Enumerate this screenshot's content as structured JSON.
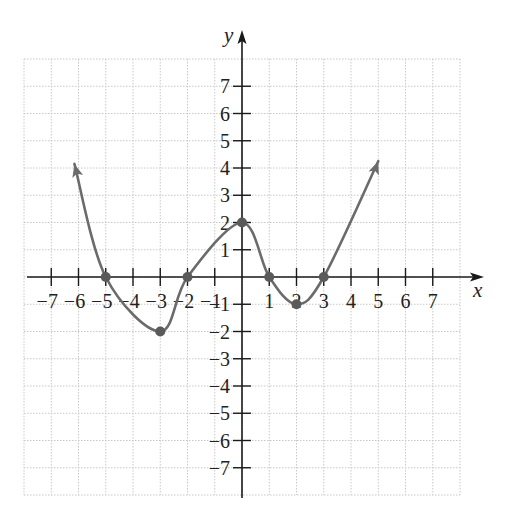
{
  "chart_data": {
    "type": "line",
    "title": "",
    "xlabel": "x",
    "ylabel": "y",
    "xlim": [
      -8,
      8
    ],
    "ylim": [
      -8,
      8
    ],
    "grid": true,
    "grid_style": "dotted",
    "x_ticks": [
      -7,
      -6,
      -5,
      -4,
      -3,
      -2,
      -1,
      1,
      2,
      3,
      4,
      5,
      6,
      7
    ],
    "y_ticks": [
      -7,
      -6,
      -5,
      -4,
      -3,
      -2,
      -1,
      1,
      2,
      3,
      4,
      5,
      6,
      7
    ],
    "x_tick_labels": [
      "−7",
      "−6",
      "−5",
      "−4",
      "−3",
      "−2",
      "−1",
      "1",
      "2",
      "3",
      "4",
      "5",
      "6",
      "7"
    ],
    "y_tick_labels": [
      "−7",
      "−6",
      "−5",
      "−4",
      "−3",
      "−2",
      "−1",
      "1",
      "2",
      "3",
      "4",
      "5",
      "6",
      "7"
    ],
    "series": [
      {
        "name": "f(x)",
        "color": "#6b6b6b",
        "arrows": "both-ends",
        "points": [
          [
            -6.15,
            4.15
          ],
          [
            -5,
            0
          ],
          [
            -3,
            -2
          ],
          [
            -2,
            0
          ],
          [
            0,
            2
          ],
          [
            1,
            0
          ],
          [
            2,
            -1
          ],
          [
            3,
            0
          ],
          [
            5,
            4.25
          ]
        ]
      }
    ],
    "marked_points": [
      {
        "x": -5,
        "y": 0,
        "kind": "x-intercept"
      },
      {
        "x": -3,
        "y": -2,
        "kind": "local-minimum"
      },
      {
        "x": -2,
        "y": 0,
        "kind": "x-intercept"
      },
      {
        "x": 0,
        "y": 2,
        "kind": "local-maximum"
      },
      {
        "x": 1,
        "y": 0,
        "kind": "x-intercept"
      },
      {
        "x": 2,
        "y": -1,
        "kind": "local-minimum"
      },
      {
        "x": 3,
        "y": 0,
        "kind": "x-intercept"
      }
    ]
  },
  "colors": {
    "axis": "#1a1a1a",
    "grid": "#c8c8c8",
    "curve": "#6b6b6b",
    "point": "#5a5a5a"
  }
}
